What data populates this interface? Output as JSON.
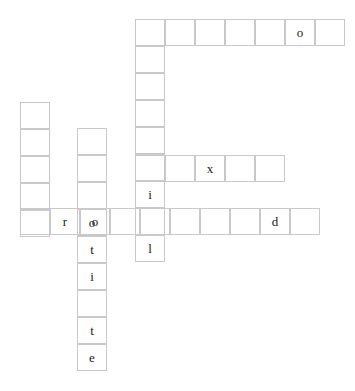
{
  "puzzle": {
    "kind": "crossword-grid",
    "cell_width": 30,
    "cell_height": 27,
    "border_color": "#c9c9c9",
    "letter_color": "#1a1a1a",
    "background_color": "#ffffff",
    "canvas": {
      "width": 355,
      "height": 391
    },
    "entries": [
      {
        "id": "across-top",
        "direction": "across",
        "origin": {
          "x": 135,
          "y": 19
        },
        "length": 7,
        "letters": [
          "",
          "",
          "",
          "",
          "",
          "o",
          ""
        ]
      },
      {
        "id": "down-center",
        "direction": "down",
        "origin": {
          "x": 135,
          "y": 19
        },
        "length": 9,
        "letters": [
          "",
          "",
          "",
          "",
          "",
          "",
          "i",
          "",
          "l"
        ]
      },
      {
        "id": "down-left",
        "direction": "down",
        "origin": {
          "x": 20,
          "y": 102
        },
        "length": 5,
        "letters": [
          "",
          "",
          "",
          "",
          ""
        ]
      },
      {
        "id": "down-otite",
        "direction": "down",
        "origin": {
          "x": 77,
          "y": 128
        },
        "length": 8,
        "letters": [
          "",
          "",
          "",
          "o",
          "t",
          "i",
          "",
          "t"
        ]
      },
      {
        "id": "down-otite-tail",
        "direction": "down",
        "origin": {
          "x": 77,
          "y": 344
        },
        "length": 1,
        "letters": [
          "e"
        ]
      },
      {
        "id": "across-x",
        "direction": "across",
        "origin": {
          "x": 135,
          "y": 155
        },
        "length": 5,
        "letters": [
          "",
          "",
          "x",
          "",
          ""
        ]
      },
      {
        "id": "across-rot",
        "direction": "across",
        "origin": {
          "x": 20,
          "y": 208
        },
        "length": 10,
        "letters": [
          "",
          "r",
          "o",
          "",
          "",
          "",
          "",
          "",
          "d",
          ""
        ]
      }
    ],
    "filled_letters": [
      "o",
      "i",
      "l",
      "o",
      "t",
      "i",
      "t",
      "e",
      "x",
      "r",
      "o",
      "d"
    ]
  }
}
